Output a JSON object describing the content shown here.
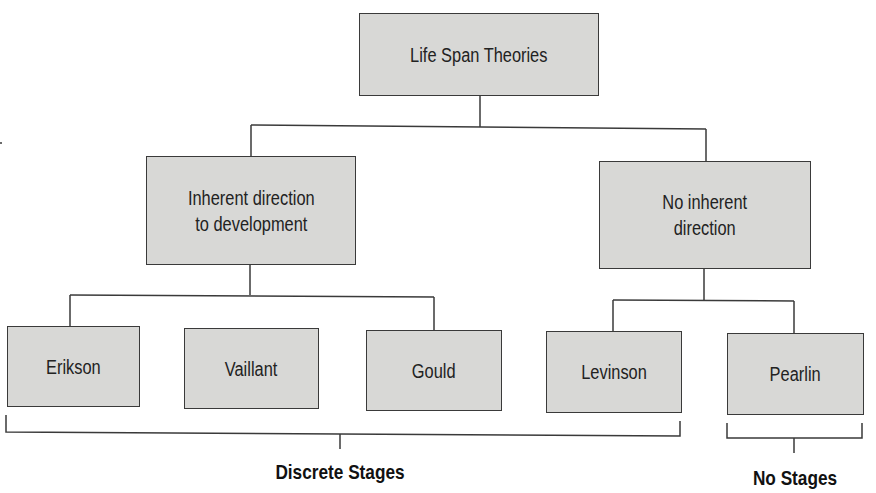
{
  "diagram": {
    "title": "Life Span Theories",
    "root": {
      "label": "Life Span Theories"
    },
    "branches": [
      {
        "label": "Inherent direction\nto development",
        "children": [
          "Erikson",
          "Vaillant",
          "Gould"
        ]
      },
      {
        "label": "No inherent\ndirection",
        "children": [
          "Levinson",
          "Pearlin"
        ]
      }
    ],
    "leaves": {
      "erikson": "Erikson",
      "vaillant": "Vaillant",
      "gould": "Gould",
      "levinson": "Levinson",
      "pearlin": "Pearlin"
    },
    "groups": [
      {
        "label": "Discrete Stages",
        "members": [
          "Erikson",
          "Vaillant",
          "Gould",
          "Levinson"
        ]
      },
      {
        "label": "No Stages",
        "members": [
          "Pearlin"
        ]
      }
    ]
  },
  "colors": {
    "node_fill": "#d8d8d6",
    "line": "#3a3a3a",
    "text": "#222222"
  }
}
